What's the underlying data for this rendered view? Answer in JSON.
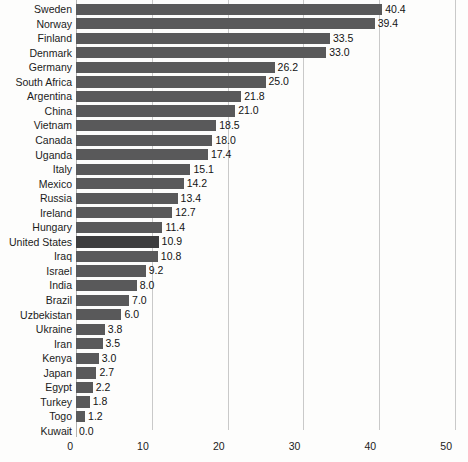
{
  "chart_data": {
    "type": "bar",
    "orientation": "horizontal",
    "title": "",
    "subtitle": "",
    "xlabel": "",
    "ylabel": "",
    "xlim": [
      0,
      50
    ],
    "xticks": [
      0,
      10,
      20,
      30,
      40,
      50
    ],
    "xtick_labels": [
      "0",
      "10",
      "20",
      "30",
      "40",
      "50"
    ],
    "grid": true,
    "grid_axis": "x",
    "legend": null,
    "bar_color": "#59595a",
    "highlight_color": "#3d3d3e",
    "highlight_category": "United States",
    "value_label_format": "one-decimal",
    "categories": [
      "Sweden",
      "Norway",
      "Finland",
      "Denmark",
      "Germany",
      "South Africa",
      "Argentina",
      "China",
      "Vietnam",
      "Canada",
      "Uganda",
      "Italy",
      "Mexico",
      "Russia",
      "Ireland",
      "Hungary",
      "United States",
      "Iraq",
      "Israel",
      "India",
      "Brazil",
      "Uzbekistan",
      "Ukraine",
      "Iran",
      "Kenya",
      "Japan",
      "Egypt",
      "Turkey",
      "Togo",
      "Kuwait"
    ],
    "values": [
      40.4,
      39.4,
      33.5,
      33.0,
      26.2,
      25.0,
      21.8,
      21.0,
      18.5,
      18.0,
      17.4,
      15.1,
      14.2,
      13.4,
      12.7,
      11.4,
      10.9,
      10.8,
      9.2,
      8.0,
      7.0,
      6.0,
      3.8,
      3.5,
      3.0,
      2.7,
      2.2,
      1.8,
      1.2,
      0.0
    ],
    "value_labels": [
      "40.4",
      "39.4",
      "33.5",
      "33.0",
      "26.2",
      "25.0",
      "21.8",
      "21.0",
      "18.5",
      "18.0",
      "17.4",
      "15.1",
      "14.2",
      "13.4",
      "12.7",
      "11.4",
      "10.9",
      "10.8",
      "9.2",
      "8.0",
      "7.0",
      "6.0",
      "3.8",
      "3.5",
      "3.0",
      "2.7",
      "2.2",
      "1.8",
      "1.2",
      "0.0"
    ]
  }
}
